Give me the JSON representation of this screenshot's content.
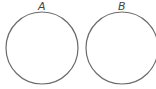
{
  "diagram": {
    "type": "two-set circles",
    "sets": [
      {
        "label": "A",
        "cx": 42,
        "cy": 48,
        "r": 36
      },
      {
        "label": "B",
        "cx": 122,
        "cy": 48,
        "r": 36
      }
    ],
    "stroke_color": "#6b6b6b"
  }
}
